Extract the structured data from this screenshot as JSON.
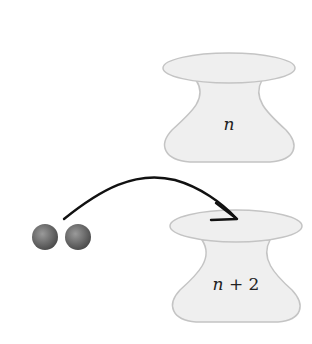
{
  "diagram": {
    "top_container": {
      "label": "n"
    },
    "bottom_container": {
      "label_var": "n",
      "label_op": " + ",
      "label_num": "2"
    },
    "particles": {
      "count": 2,
      "color": "#6a6a6a"
    },
    "arrow": {
      "direction": "particles-to-bottom-container"
    },
    "colors": {
      "container_fill": "#efefef",
      "container_stroke": "#c4c4c4",
      "arrow": "#111111",
      "text": "#222222"
    }
  }
}
